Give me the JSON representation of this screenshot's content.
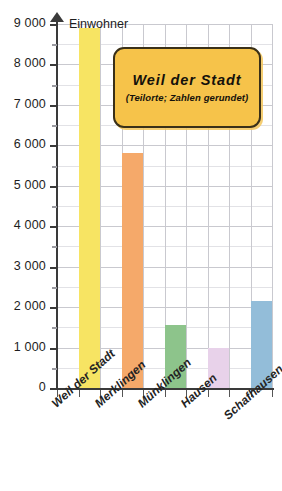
{
  "chart_data": {
    "type": "bar",
    "title": "Weil der Stadt",
    "subtitle": "(Teilorte; Zahlen gerundet)",
    "xlabel": "",
    "ylabel": "Einwohner",
    "ylim": [
      0,
      9000
    ],
    "ytick_step": 1000,
    "yminor_step": 500,
    "grid": true,
    "legend": "none",
    "categories": [
      "Weil der Stadt",
      "Merklingen",
      "Münklingen",
      "Hausen",
      "Schafhausen"
    ],
    "values": [
      8900,
      5800,
      1550,
      1000,
      2150
    ],
    "colors": [
      "#f7e463",
      "#f5a96a",
      "#8dc48b",
      "#e8d2ea",
      "#93bdd9"
    ],
    "ytick_labels": [
      "0",
      "1 000",
      "2 000",
      "3 000",
      "4 000",
      "5 000",
      "6 000",
      "7 000",
      "8 000",
      "9 000"
    ]
  },
  "axis": {
    "y_title": "Einwohner"
  },
  "callout": {
    "title": "Weil der Stadt",
    "subtitle": "(Teilorte; Zahlen gerundet)"
  }
}
